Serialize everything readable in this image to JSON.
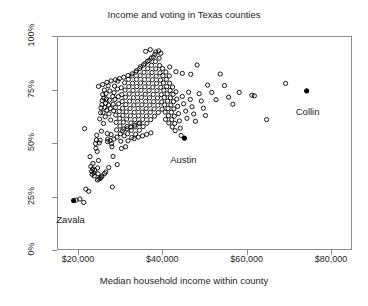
{
  "chart_data": {
    "type": "scatter",
    "title": "Income and voting in Texas counties",
    "xlabel": "Median household income within county",
    "ylabel": "Vote share for George Bush",
    "xlim": [
      15000,
      85000
    ],
    "ylim": [
      0,
      1
    ],
    "grid": false,
    "legend": null,
    "xticks": [
      {
        "value": 20000,
        "label": "$20,000"
      },
      {
        "value": 40000,
        "label": "$40,000"
      },
      {
        "value": 60000,
        "label": "$60,000"
      },
      {
        "value": 80000,
        "label": "$80,000"
      }
    ],
    "yticks": [
      {
        "value": 0.0,
        "label": "0%"
      },
      {
        "value": 0.25,
        "label": "25%"
      },
      {
        "value": 0.5,
        "label": "50%"
      },
      {
        "value": 0.75,
        "label": "75%"
      },
      {
        "value": 1.0,
        "label": "100%"
      }
    ],
    "marker": {
      "open_shape": "circle-open",
      "filled_shape": "circle-filled",
      "radius": 2.1,
      "color": "#000000"
    },
    "annotations": [
      {
        "text": "Zavala",
        "x": 18700,
        "y": 0.235,
        "dx": -2,
        "dy": 14
      },
      {
        "text": "Austin",
        "x": 45000,
        "y": 0.527,
        "dx": 0,
        "dy": 17
      },
      {
        "text": "Collin",
        "x": 74000,
        "y": 0.748,
        "dx": 2,
        "dy": 16
      }
    ],
    "highlighted": [
      {
        "name": "Zavala",
        "x": 18700,
        "y": 0.235
      },
      {
        "name": "Austin",
        "x": 45000,
        "y": 0.527
      },
      {
        "name": "Collin",
        "x": 74000,
        "y": 0.748
      }
    ],
    "points": [
      [
        18700,
        0.235
      ],
      [
        19300,
        0.238
      ],
      [
        20200,
        0.243
      ],
      [
        21100,
        0.227
      ],
      [
        21600,
        0.289
      ],
      [
        21300,
        0.572
      ],
      [
        22300,
        0.279
      ],
      [
        22600,
        0.441
      ],
      [
        22800,
        0.395
      ],
      [
        23000,
        0.372
      ],
      [
        23100,
        0.358
      ],
      [
        23200,
        0.383
      ],
      [
        23300,
        0.409
      ],
      [
        23500,
        0.365
      ],
      [
        23600,
        0.351
      ],
      [
        23700,
        0.378
      ],
      [
        23900,
        0.502
      ],
      [
        24000,
        0.48
      ],
      [
        24100,
        0.519
      ],
      [
        24200,
        0.541
      ],
      [
        24300,
        0.465
      ],
      [
        24400,
        0.388
      ],
      [
        24500,
        0.361
      ],
      [
        24600,
        0.423
      ],
      [
        24800,
        0.505
      ],
      [
        24900,
        0.617
      ],
      [
        25000,
        0.518
      ],
      [
        25100,
        0.646
      ],
      [
        25200,
        0.669
      ],
      [
        25300,
        0.56
      ],
      [
        25400,
        0.684
      ],
      [
        25500,
        0.703
      ],
      [
        25600,
        0.731
      ],
      [
        25700,
        0.646
      ],
      [
        25800,
        0.596
      ],
      [
        25900,
        0.714
      ],
      [
        26000,
        0.752
      ],
      [
        26100,
        0.671
      ],
      [
        26200,
        0.627
      ],
      [
        26300,
        0.69
      ],
      [
        26400,
        0.736
      ],
      [
        26500,
        0.711
      ],
      [
        26600,
        0.658
      ],
      [
        26700,
        0.549
      ],
      [
        26800,
        0.523
      ],
      [
        26900,
        0.772
      ],
      [
        27000,
        0.682
      ],
      [
        27100,
        0.641
      ],
      [
        27200,
        0.705
      ],
      [
        27300,
        0.748
      ],
      [
        27400,
        0.666
      ],
      [
        27500,
        0.612
      ],
      [
        27600,
        0.544
      ],
      [
        27700,
        0.501
      ],
      [
        27800,
        0.487
      ],
      [
        27900,
        0.299
      ],
      [
        28000,
        0.722
      ],
      [
        28100,
        0.686
      ],
      [
        28200,
        0.655
      ],
      [
        28300,
        0.74
      ],
      [
        28400,
        0.771
      ],
      [
        28500,
        0.708
      ],
      [
        28600,
        0.67
      ],
      [
        28700,
        0.635
      ],
      [
        28800,
        0.601
      ],
      [
        28900,
        0.566
      ],
      [
        29000,
        0.532
      ],
      [
        29100,
        0.757
      ],
      [
        29200,
        0.794
      ],
      [
        29300,
        0.721
      ],
      [
        29400,
        0.688
      ],
      [
        29500,
        0.652
      ],
      [
        29600,
        0.619
      ],
      [
        29700,
        0.584
      ],
      [
        29800,
        0.548
      ],
      [
        29900,
        0.513
      ],
      [
        30000,
        0.763
      ],
      [
        30100,
        0.731
      ],
      [
        30200,
        0.699
      ],
      [
        30300,
        0.667
      ],
      [
        30400,
        0.634
      ],
      [
        30500,
        0.602
      ],
      [
        30600,
        0.57
      ],
      [
        30700,
        0.538
      ],
      [
        30800,
        0.786
      ],
      [
        30900,
        0.752
      ],
      [
        31000,
        0.718
      ],
      [
        31100,
        0.684
      ],
      [
        31200,
        0.65
      ],
      [
        31300,
        0.616
      ],
      [
        31400,
        0.582
      ],
      [
        31500,
        0.548
      ],
      [
        31600,
        0.515
      ],
      [
        31700,
        0.802
      ],
      [
        31800,
        0.768
      ],
      [
        31900,
        0.734
      ],
      [
        32000,
        0.7
      ],
      [
        32100,
        0.666
      ],
      [
        32200,
        0.632
      ],
      [
        32300,
        0.598
      ],
      [
        32400,
        0.564
      ],
      [
        32500,
        0.53
      ],
      [
        32600,
        0.818
      ],
      [
        32700,
        0.784
      ],
      [
        32800,
        0.75
      ],
      [
        32900,
        0.716
      ],
      [
        33000,
        0.682
      ],
      [
        33100,
        0.648
      ],
      [
        33200,
        0.614
      ],
      [
        33300,
        0.58
      ],
      [
        33400,
        0.546
      ],
      [
        33500,
        0.836
      ],
      [
        33600,
        0.802
      ],
      [
        33700,
        0.768
      ],
      [
        33800,
        0.734
      ],
      [
        33900,
        0.7
      ],
      [
        34000,
        0.666
      ],
      [
        34100,
        0.632
      ],
      [
        34200,
        0.598
      ],
      [
        34300,
        0.564
      ],
      [
        34400,
        0.853
      ],
      [
        34500,
        0.819
      ],
      [
        34600,
        0.785
      ],
      [
        34700,
        0.751
      ],
      [
        34800,
        0.717
      ],
      [
        34900,
        0.683
      ],
      [
        35000,
        0.649
      ],
      [
        35100,
        0.615
      ],
      [
        35200,
        0.581
      ],
      [
        35300,
        0.869
      ],
      [
        35400,
        0.835
      ],
      [
        35500,
        0.801
      ],
      [
        35600,
        0.767
      ],
      [
        35700,
        0.733
      ],
      [
        35800,
        0.699
      ],
      [
        35900,
        0.665
      ],
      [
        36000,
        0.631
      ],
      [
        36100,
        0.597
      ],
      [
        36200,
        0.886
      ],
      [
        36300,
        0.852
      ],
      [
        36400,
        0.818
      ],
      [
        36500,
        0.784
      ],
      [
        36600,
        0.75
      ],
      [
        36700,
        0.716
      ],
      [
        36800,
        0.682
      ],
      [
        36900,
        0.648
      ],
      [
        37000,
        0.614
      ],
      [
        37100,
        0.902
      ],
      [
        37200,
        0.868
      ],
      [
        37300,
        0.834
      ],
      [
        37400,
        0.8
      ],
      [
        37500,
        0.766
      ],
      [
        37600,
        0.732
      ],
      [
        37700,
        0.698
      ],
      [
        37800,
        0.664
      ],
      [
        37900,
        0.63
      ],
      [
        38000,
        0.919
      ],
      [
        38100,
        0.885
      ],
      [
        38200,
        0.851
      ],
      [
        38300,
        0.817
      ],
      [
        38400,
        0.783
      ],
      [
        38500,
        0.749
      ],
      [
        38600,
        0.715
      ],
      [
        38700,
        0.681
      ],
      [
        38800,
        0.647
      ],
      [
        38900,
        0.935
      ],
      [
        39000,
        0.901
      ],
      [
        39100,
        0.867
      ],
      [
        39200,
        0.833
      ],
      [
        39300,
        0.799
      ],
      [
        39400,
        0.765
      ],
      [
        39500,
        0.731
      ],
      [
        39600,
        0.697
      ],
      [
        39700,
        0.663
      ],
      [
        39800,
        0.853
      ],
      [
        39900,
        0.819
      ],
      [
        40000,
        0.785
      ],
      [
        40100,
        0.751
      ],
      [
        40200,
        0.717
      ],
      [
        40300,
        0.683
      ],
      [
        40400,
        0.649
      ],
      [
        40500,
        0.615
      ],
      [
        40600,
        0.836
      ],
      [
        40700,
        0.802
      ],
      [
        40800,
        0.768
      ],
      [
        40900,
        0.734
      ],
      [
        41000,
        0.7
      ],
      [
        41100,
        0.666
      ],
      [
        41200,
        0.632
      ],
      [
        41300,
        0.598
      ],
      [
        41400,
        0.818
      ],
      [
        41500,
        0.784
      ],
      [
        41600,
        0.75
      ],
      [
        41700,
        0.716
      ],
      [
        41800,
        0.682
      ],
      [
        41900,
        0.648
      ],
      [
        42000,
        0.614
      ],
      [
        42100,
        0.58
      ],
      [
        42200,
        0.766
      ],
      [
        42300,
        0.732
      ],
      [
        42400,
        0.698
      ],
      [
        42500,
        0.664
      ],
      [
        42600,
        0.63
      ],
      [
        42700,
        0.596
      ],
      [
        42800,
        0.562
      ],
      [
        43000,
        0.744
      ],
      [
        43200,
        0.71
      ],
      [
        43400,
        0.676
      ],
      [
        43600,
        0.642
      ],
      [
        43800,
        0.608
      ],
      [
        44000,
        0.574
      ],
      [
        44200,
        0.54
      ],
      [
        44500,
        0.722
      ],
      [
        44800,
        0.688
      ],
      [
        45000,
        0.527
      ],
      [
        45300,
        0.654
      ],
      [
        45600,
        0.62
      ],
      [
        46000,
        0.742
      ],
      [
        46400,
        0.708
      ],
      [
        46800,
        0.674
      ],
      [
        47200,
        0.64
      ],
      [
        47600,
        0.606
      ],
      [
        48000,
        0.869
      ],
      [
        48500,
        0.735
      ],
      [
        49000,
        0.701
      ],
      [
        49500,
        0.667
      ],
      [
        50000,
        0.633
      ],
      [
        50500,
        0.775
      ],
      [
        51500,
        0.741
      ],
      [
        52500,
        0.707
      ],
      [
        53500,
        0.827
      ],
      [
        54500,
        0.773
      ],
      [
        55500,
        0.719
      ],
      [
        56500,
        0.686
      ],
      [
        58000,
        0.741
      ],
      [
        61000,
        0.728
      ],
      [
        61600,
        0.725
      ],
      [
        64500,
        0.614
      ],
      [
        69000,
        0.783
      ],
      [
        74000,
        0.748
      ],
      [
        24700,
        0.336
      ],
      [
        25050,
        0.34
      ],
      [
        25250,
        0.345
      ],
      [
        25450,
        0.35
      ],
      [
        24350,
        0.332
      ],
      [
        26050,
        0.362
      ],
      [
        26350,
        0.369
      ],
      [
        27050,
        0.39
      ],
      [
        28050,
        0.442
      ],
      [
        29050,
        0.404
      ],
      [
        30050,
        0.479
      ],
      [
        31050,
        0.487
      ],
      [
        26750,
        0.511
      ],
      [
        27350,
        0.516
      ],
      [
        28250,
        0.523
      ],
      [
        33050,
        0.525
      ],
      [
        34050,
        0.532
      ],
      [
        35050,
        0.538
      ],
      [
        36050,
        0.545
      ],
      [
        37050,
        0.552
      ],
      [
        30250,
        0.561
      ],
      [
        31350,
        0.571
      ],
      [
        32250,
        0.579
      ],
      [
        33250,
        0.588
      ],
      [
        34350,
        0.596
      ],
      [
        28600,
        0.8
      ],
      [
        29600,
        0.806
      ],
      [
        30600,
        0.812
      ],
      [
        31600,
        0.82
      ],
      [
        32600,
        0.828
      ],
      [
        33600,
        0.842
      ],
      [
        34600,
        0.861
      ],
      [
        35600,
        0.875
      ],
      [
        36600,
        0.89
      ],
      [
        37600,
        0.906
      ],
      [
        27600,
        0.795
      ],
      [
        26600,
        0.788
      ],
      [
        25600,
        0.778
      ],
      [
        24600,
        0.769
      ],
      [
        35800,
        0.933
      ],
      [
        36900,
        0.941
      ],
      [
        38200,
        0.93
      ],
      [
        39400,
        0.924
      ],
      [
        41500,
        0.86
      ],
      [
        43000,
        0.838
      ],
      [
        44500,
        0.83
      ],
      [
        46500,
        0.826
      ]
    ]
  }
}
